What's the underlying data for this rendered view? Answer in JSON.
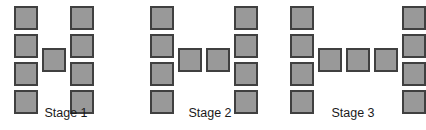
{
  "figure": {
    "background_color": "#ffffff",
    "square_fill_color": "#999999",
    "square_border_color": "#404040",
    "label_color": "#1a1a1a",
    "square_size_px": 24
  },
  "chart_data": {
    "type": "diagram",
    "title": "",
    "categories": [
      "Stage 1",
      "Stage 2",
      "Stage 3"
    ],
    "values": [
      9,
      10,
      11
    ],
    "series": [
      {
        "name": "left column squares",
        "values": [
          4,
          4,
          4
        ]
      },
      {
        "name": "right column squares",
        "values": [
          4,
          4,
          4
        ]
      },
      {
        "name": "middle bar squares",
        "values": [
          1,
          2,
          3
        ]
      },
      {
        "name": "total squares",
        "values": [
          9,
          10,
          11
        ]
      }
    ],
    "xlabel": "",
    "ylabel": "",
    "grid": false,
    "legend": false
  },
  "stages": [
    {
      "label": "Stage 1",
      "left_px": 0,
      "width_px": 132,
      "squares": [
        {
          "name": "left-col-1",
          "x": 14,
          "y": 6
        },
        {
          "name": "left-col-2",
          "x": 14,
          "y": 34
        },
        {
          "name": "left-col-3",
          "x": 14,
          "y": 62
        },
        {
          "name": "left-col-4",
          "x": 14,
          "y": 90
        },
        {
          "name": "middle-bar-1",
          "x": 42,
          "y": 48
        },
        {
          "name": "right-col-1",
          "x": 70,
          "y": 6
        },
        {
          "name": "right-col-2",
          "x": 70,
          "y": 34
        },
        {
          "name": "right-col-3",
          "x": 70,
          "y": 62
        },
        {
          "name": "right-col-4",
          "x": 70,
          "y": 90
        }
      ]
    },
    {
      "label": "Stage 2",
      "left_px": 140,
      "width_px": 140,
      "squares": [
        {
          "name": "left-col-1",
          "x": 10,
          "y": 6
        },
        {
          "name": "left-col-2",
          "x": 10,
          "y": 34
        },
        {
          "name": "left-col-3",
          "x": 10,
          "y": 62
        },
        {
          "name": "left-col-4",
          "x": 10,
          "y": 90
        },
        {
          "name": "middle-bar-1",
          "x": 38,
          "y": 48
        },
        {
          "name": "middle-bar-2",
          "x": 66,
          "y": 48
        },
        {
          "name": "right-col-1",
          "x": 94,
          "y": 6
        },
        {
          "name": "right-col-2",
          "x": 94,
          "y": 34
        },
        {
          "name": "right-col-3",
          "x": 94,
          "y": 62
        },
        {
          "name": "right-col-4",
          "x": 94,
          "y": 90
        }
      ]
    },
    {
      "label": "Stage 3",
      "left_px": 284,
      "width_px": 138,
      "squares": [
        {
          "name": "left-col-1",
          "x": 6,
          "y": 6
        },
        {
          "name": "left-col-2",
          "x": 6,
          "y": 34
        },
        {
          "name": "left-col-3",
          "x": 6,
          "y": 62
        },
        {
          "name": "left-col-4",
          "x": 6,
          "y": 90
        },
        {
          "name": "middle-bar-1",
          "x": 34,
          "y": 48
        },
        {
          "name": "middle-bar-2",
          "x": 62,
          "y": 48
        },
        {
          "name": "middle-bar-3",
          "x": 90,
          "y": 48
        },
        {
          "name": "right-col-1",
          "x": 118,
          "y": 6
        },
        {
          "name": "right-col-2",
          "x": 118,
          "y": 34
        },
        {
          "name": "right-col-3",
          "x": 118,
          "y": 62
        },
        {
          "name": "right-col-4",
          "x": 118,
          "y": 90
        }
      ]
    }
  ]
}
